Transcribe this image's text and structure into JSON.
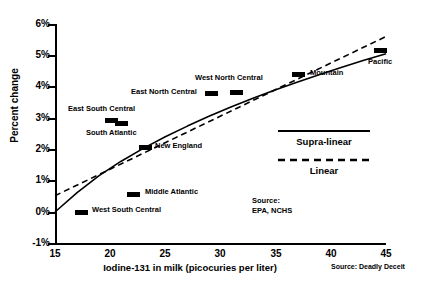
{
  "chart_data": {
    "type": "scatter",
    "title": "",
    "xlabel": "Iodine-131 in milk (picocuries per liter)",
    "ylabel": "Percent change",
    "xlim": [
      15,
      45
    ],
    "ylim": [
      -1,
      6
    ],
    "xticks": [
      15,
      20,
      25,
      30,
      35,
      40,
      45
    ],
    "xtick_labels": [
      "15",
      "20",
      "25",
      "30",
      "35",
      "40",
      "45"
    ],
    "yticks": [
      -1,
      0,
      1,
      2,
      3,
      4,
      5,
      6
    ],
    "ytick_labels": [
      "-1%",
      "0%",
      "1%",
      "2%",
      "3%",
      "4%",
      "5%",
      "6%"
    ],
    "grid": false,
    "points": [
      {
        "name": "West South Central",
        "x": 17.2,
        "y": 0.45,
        "label_pos": "right",
        "marker_px": {
          "x": 75,
          "y": 210
        },
        "label_px": {
          "x": 92,
          "y": 205
        }
      },
      {
        "name": "Middle Atlantic",
        "x": 22.1,
        "y": 1.05,
        "label_pos": "right",
        "marker_px": {
          "x": 127,
          "y": 192
        },
        "label_px": {
          "x": 145,
          "y": 187
        }
      },
      {
        "name": "East South Central",
        "x": 20.6,
        "y": 2.62,
        "label_pos": "above",
        "marker_px": {
          "x": 105,
          "y": 118
        },
        "label_px": {
          "x": 68,
          "y": 104
        }
      },
      {
        "name": "South Atlantic",
        "x": 21.5,
        "y": 2.55,
        "label_pos": "below",
        "marker_px": {
          "x": 115,
          "y": 121
        },
        "label_px": {
          "x": 86,
          "y": 128
        }
      },
      {
        "name": "New England",
        "x": 22.7,
        "y": 1.97,
        "label_pos": "right",
        "marker_px": {
          "x": 139,
          "y": 145
        },
        "label_px": {
          "x": 155,
          "y": 141
        }
      },
      {
        "name": "East North Central",
        "x": 28.7,
        "y": 3.52,
        "label_pos": "left",
        "marker_px": {
          "x": 205,
          "y": 91
        },
        "label_px": {
          "x": 131,
          "y": 87
        }
      },
      {
        "name": "West North Central",
        "x": 30.9,
        "y": 3.62,
        "label_pos": "above",
        "marker_px": {
          "x": 230,
          "y": 90
        },
        "label_px": {
          "x": 195,
          "y": 73
        }
      },
      {
        "name": "Mountain",
        "x": 38.3,
        "y": 4.25,
        "label_pos": "right",
        "marker_px": {
          "x": 292,
          "y": 72
        },
        "label_px": {
          "x": 310,
          "y": 68
        }
      },
      {
        "name": "Pacific",
        "x": 44.0,
        "y": 5.02,
        "label_pos": "below",
        "marker_px": {
          "x": 374,
          "y": 48
        },
        "label_px": {
          "x": 368,
          "y": 57
        }
      }
    ],
    "series": [
      {
        "name": "Supra-linear",
        "style": "solid",
        "x": [
          15,
          17,
          19,
          21,
          23,
          25,
          27,
          29,
          31,
          33,
          35,
          37,
          39,
          41,
          43,
          45
        ],
        "y": [
          0.0,
          0.62,
          1.16,
          1.62,
          2.03,
          2.4,
          2.74,
          3.06,
          3.36,
          3.64,
          3.9,
          4.15,
          4.39,
          4.62,
          4.84,
          5.05
        ]
      },
      {
        "name": "Linear",
        "style": "dashed",
        "x": [
          15,
          45
        ],
        "y": [
          0.52,
          5.6
        ]
      }
    ],
    "legend": {
      "position": "inside-right",
      "entries": [
        {
          "label": "Supra-linear",
          "style": "solid"
        },
        {
          "label": "Linear",
          "style": "dashed"
        }
      ]
    },
    "annotations": {
      "source_note": "Source:\nEPA, NCHS",
      "credit": "Source: Deadly Deceit"
    }
  }
}
